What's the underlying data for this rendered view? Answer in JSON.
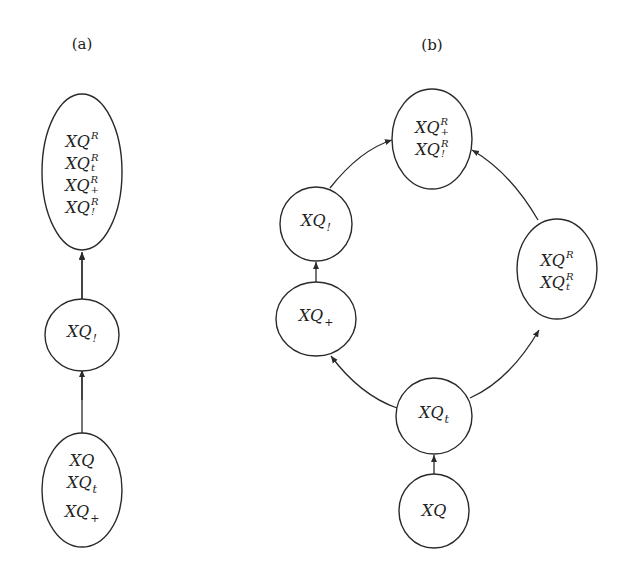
{
  "panels": {
    "a": {
      "label": "(a)"
    },
    "b": {
      "label": "(b)"
    }
  },
  "diagram_a": {
    "nodes": [
      {
        "id": "a_top",
        "terms": [
          {
            "base": "XQ",
            "sup": "R",
            "sub": ""
          },
          {
            "base": "XQ",
            "sup": "R",
            "sub": "t"
          },
          {
            "base": "XQ",
            "sup": "R",
            "sub": "+"
          },
          {
            "base": "XQ",
            "sup": "R",
            "sub": "!"
          }
        ]
      },
      {
        "id": "a_mid",
        "terms": [
          {
            "base": "XQ",
            "sup": "",
            "sub": "!"
          }
        ]
      },
      {
        "id": "a_bottom",
        "terms": [
          {
            "base": "XQ",
            "sup": "",
            "sub": ""
          },
          {
            "base": "XQ",
            "sup": "",
            "sub": "t"
          },
          {
            "base": "XQ",
            "sup": "",
            "sub": "+"
          }
        ]
      }
    ],
    "edges": [
      {
        "from": "a_bottom",
        "to": "a_mid"
      },
      {
        "from": "a_mid",
        "to": "a_top"
      }
    ]
  },
  "diagram_b": {
    "nodes": [
      {
        "id": "b_top",
        "terms": [
          {
            "base": "XQ",
            "sup": "R",
            "sub": "+"
          },
          {
            "base": "XQ",
            "sup": "R",
            "sub": "!"
          }
        ]
      },
      {
        "id": "b_left_upper",
        "terms": [
          {
            "base": "XQ",
            "sup": "",
            "sub": "!"
          }
        ]
      },
      {
        "id": "b_left_lower",
        "terms": [
          {
            "base": "XQ",
            "sup": "",
            "sub": "+"
          }
        ]
      },
      {
        "id": "b_right",
        "terms": [
          {
            "base": "XQ",
            "sup": "R",
            "sub": ""
          },
          {
            "base": "XQ",
            "sup": "R",
            "sub": "t"
          }
        ]
      },
      {
        "id": "b_center",
        "terms": [
          {
            "base": "XQ",
            "sup": "",
            "sub": "t"
          }
        ]
      },
      {
        "id": "b_bottom",
        "terms": [
          {
            "base": "XQ",
            "sup": "",
            "sub": ""
          }
        ]
      }
    ],
    "edges": [
      {
        "from": "b_bottom",
        "to": "b_center"
      },
      {
        "from": "b_center",
        "to": "b_left_lower"
      },
      {
        "from": "b_left_lower",
        "to": "b_left_upper"
      },
      {
        "from": "b_left_upper",
        "to": "b_top"
      },
      {
        "from": "b_center",
        "to": "b_right"
      },
      {
        "from": "b_right",
        "to": "b_top"
      }
    ]
  }
}
